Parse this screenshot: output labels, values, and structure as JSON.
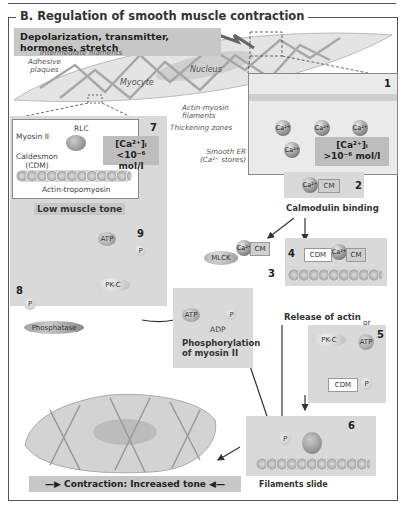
{
  "panel": {
    "title": "B.  Regulation of smooth muscle contraction"
  },
  "stimulus_banner": "Depolarization, transmitter, hormones, stretch",
  "myocyte_labels": {
    "intermediate_filaments": "Intermediate filaments",
    "adhesive_plaques_1": "Adhesive",
    "adhesive_plaques_2": "plaques",
    "myocyte": "Myocyte",
    "nucleus": "Nucleus",
    "actin_myosin_1": "Actin-myosin",
    "actin_myosin_2": "filaments",
    "thickening_zones": "Thickening zones",
    "smooth_er_1": "Smooth ER",
    "smooth_er_2": "(Ca²⁺ stores)"
  },
  "step1": {
    "number": "1",
    "ion": "Ca²⁺",
    "concentration_1": "[Ca²⁺]ᵢ",
    "concentration_2": ">10⁻⁶ mol/l"
  },
  "step2": {
    "number": "2",
    "ion": "Ca²⁺",
    "cm": "CM",
    "label": "Calmodulin binding"
  },
  "step3": {
    "number": "3",
    "mlck": "MLCK",
    "ion": "Ca²⁺",
    "cm": "CM",
    "atp": "ATP",
    "adp": "ADP",
    "p": "P",
    "label_1": "Phosphorylation",
    "label_2": "of myosin II"
  },
  "step4": {
    "number": "4",
    "cdm": "CDM",
    "ion": "Ca²⁺",
    "cm": "CM",
    "label": "Release of actin"
  },
  "step5": {
    "number": "5",
    "or": "or",
    "pkc": "PK-C",
    "atp": "ATP",
    "cdm": "CDM",
    "p": "P"
  },
  "step6": {
    "number": "6",
    "p": "P",
    "label": "Filaments slide"
  },
  "step7": {
    "number": "7",
    "rlc": "RLC",
    "myosin": "Myosin II",
    "caldesmon_1": "Caldesmon",
    "caldesmon_2": "(CDM)",
    "actin": "Actin-tropomyosin",
    "concentration_1": "[Ca²⁺]ᵢ",
    "concentration_2": "<10⁻⁶ mol/l",
    "label": "Low muscle tone"
  },
  "step8": {
    "number": "8",
    "p": "P",
    "phosphatase": "Phosphatase"
  },
  "step9": {
    "number": "9",
    "atp": "ATP",
    "p": "P",
    "pkc": "PK-C"
  },
  "result_banner": "Contraction: Increased tone",
  "colors": {
    "panel_bg": "#d9d9d9",
    "banner_bg": "#c7c7c7",
    "border": "#555555"
  }
}
